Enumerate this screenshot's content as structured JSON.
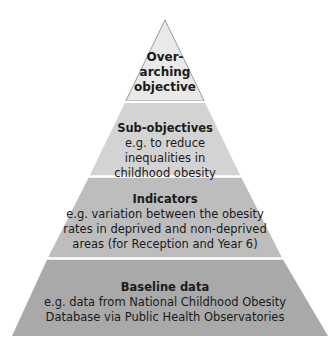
{
  "diagram": {
    "type": "pyramid",
    "layers": [
      {
        "title": "Over-\narching\nobjective",
        "title_lines": [
          "Over-",
          "arching",
          "objective"
        ],
        "description": "",
        "fill": "#e9e9e9"
      },
      {
        "title": "Sub-objectives",
        "description_lines": [
          "e.g. to reduce",
          "inequalities in",
          "childhood obesity"
        ],
        "fill": "#d3d3d3"
      },
      {
        "title": "Indicators",
        "description_lines": [
          "e.g. variation between the obesity",
          "rates in deprived and non-deprived",
          "areas (for Reception and Year 6)"
        ],
        "fill": "#bdbdbd"
      },
      {
        "title": "Baseline data",
        "description_lines": [
          "e.g. data from National Childhood Obesity",
          "Database via Public Health Observatories"
        ],
        "fill": "#a9a9a9"
      }
    ],
    "outline_color": "#9a9a9a",
    "divider_color": "#ffffff"
  }
}
